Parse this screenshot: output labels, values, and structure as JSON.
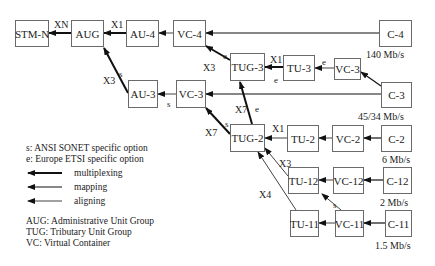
{
  "boxes": {
    "stm_n": "STM-N",
    "aug": "AUG",
    "au4": "AU-4",
    "vc4": "VC-4",
    "c4": "C-4",
    "tug3": "TUG-3",
    "tu3": "TU-3",
    "vc3_right": "VC-3",
    "c3": "C-3",
    "au3": "AU-3",
    "vc3_left": "VC-3",
    "tug2": "TUG-2",
    "tu2": "TU-2",
    "vc2": "VC-2",
    "c2": "C-2",
    "tu12": "TU-12",
    "vc12": "VC-12",
    "c12": "C-12",
    "tu11": "TU-11",
    "vc11": "VC-11",
    "c11": "C-11"
  },
  "rates": {
    "c4": "140 Mb/s",
    "c3": "45/34 Mb/s",
    "c2": "6 Mb/s",
    "c12": "2 Mb/s",
    "c11": "1.5 Mb/s"
  },
  "edge_labels": {
    "xn": "XN",
    "x1_aug": "X1",
    "x3_au3": "X3",
    "s_au3": "s",
    "s_vc3": "s",
    "x3_tug3": "X3",
    "e_tug3_vc4": "e",
    "x1_tug3": "X1",
    "e_tug3_tu3": "e",
    "e_tu3": "e",
    "x7_tug3": "X7",
    "e_tug2": "e",
    "x7_vc3": "X7",
    "s_tug2": "s",
    "x1_tug2": "X1",
    "x3_tu12": "X3",
    "x4_tu11": "X4",
    "s_vc11": "s"
  },
  "legend": {
    "s_option": "s: ANSI SONET specific option",
    "e_option": "e: Europe ETSI specific option",
    "multiplexing": "multiplexing",
    "mapping": "mapping",
    "aligning": "aligning",
    "aug_def": "AUG: Administrative Unit Group",
    "tug_def": "TUG: Tributary Unit Group",
    "vc_def": "VC: Virtual Container"
  }
}
